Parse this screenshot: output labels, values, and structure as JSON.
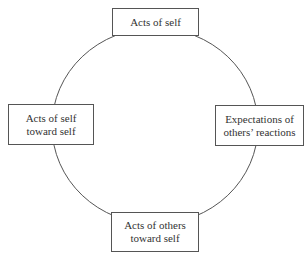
{
  "diagram": {
    "type": "cycle",
    "nodes": [
      {
        "id": "top",
        "lines": [
          "Acts of self"
        ]
      },
      {
        "id": "right",
        "lines": [
          "Expectations of",
          "others’ reactions"
        ]
      },
      {
        "id": "bottom",
        "lines": [
          "Acts of others",
          "toward self"
        ]
      },
      {
        "id": "left",
        "lines": [
          "Acts of self",
          "toward self"
        ]
      }
    ],
    "connector": "circle"
  }
}
